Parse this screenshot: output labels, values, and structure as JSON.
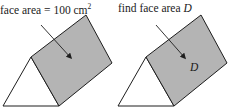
{
  "figures": [
    {
      "id": "left",
      "caption_prefix": "face area = 100 cm",
      "caption_sup": "2",
      "face_label": ""
    },
    {
      "id": "right",
      "caption_prefix": "find face area ",
      "caption_var": "D",
      "face_label": "D"
    }
  ],
  "colors": {
    "face_fill": "#b4b4b4",
    "stroke": "#1e1e1e",
    "triangle_fill": "#ffffff"
  }
}
